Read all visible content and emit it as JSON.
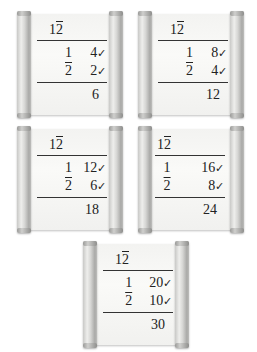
{
  "multiplier": {
    "whole": "1",
    "fraction": "2",
    "fraction_note": "overline denotes unit fraction 1/2"
  },
  "scrolls": [
    {
      "header": {
        "whole": "1",
        "fraction": "2"
      },
      "rows": [
        {
          "mult": "1",
          "mult_overline": false,
          "value": "4",
          "check": "✓"
        },
        {
          "mult": "2",
          "mult_overline": true,
          "value": "2",
          "check": "✓"
        }
      ],
      "sum": "6"
    },
    {
      "header": {
        "whole": "1",
        "fraction": "2"
      },
      "rows": [
        {
          "mult": "1",
          "mult_overline": false,
          "value": "8",
          "check": "✓"
        },
        {
          "mult": "2",
          "mult_overline": true,
          "value": "4",
          "check": "✓"
        }
      ],
      "sum": "12"
    },
    {
      "header": {
        "whole": "1",
        "fraction": "2"
      },
      "rows": [
        {
          "mult": "1",
          "mult_overline": false,
          "value": "12",
          "check": "✓"
        },
        {
          "mult": "2",
          "mult_overline": true,
          "value": "6",
          "check": "✓"
        }
      ],
      "sum": "18"
    },
    {
      "header": {
        "whole": "1",
        "fraction": "2"
      },
      "rows": [
        {
          "mult": "1",
          "mult_overline": false,
          "value": "16",
          "check": "✓"
        },
        {
          "mult": "2",
          "mult_overline": true,
          "value": "8",
          "check": "✓"
        }
      ],
      "sum": "24"
    },
    {
      "header": {
        "whole": "1",
        "fraction": "2"
      },
      "rows": [
        {
          "mult": "1",
          "mult_overline": false,
          "value": "20",
          "check": "✓"
        },
        {
          "mult": "2",
          "mult_overline": true,
          "value": "10",
          "check": "✓"
        }
      ],
      "sum": "30"
    }
  ],
  "colors": {
    "background": "#ffffff",
    "paper": "#f5f5f3",
    "ink": "#222222",
    "rod": "#c9c9c7"
  }
}
